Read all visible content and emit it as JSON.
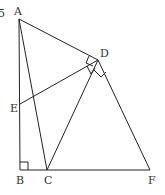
{
  "diagram": {
    "type": "geometry",
    "points": {
      "A": {
        "label": "A",
        "x": 19,
        "y": 19
      },
      "B": {
        "label": "B",
        "x": 20,
        "y": 170
      },
      "C": {
        "label": "C",
        "x": 47,
        "y": 170
      },
      "D": {
        "label": "D",
        "x": 98,
        "y": 60
      },
      "E": {
        "label": "E",
        "x": 20,
        "y": 104
      },
      "F": {
        "label": "F",
        "x": 150,
        "y": 170
      }
    },
    "segments": [
      "AB",
      "BC",
      "CF",
      "AC",
      "AD",
      "DE",
      "DC",
      "DF"
    ],
    "right_angles": [
      "ABC",
      "ADE",
      "EDC",
      "CDF"
    ],
    "corner_mark": "5"
  }
}
